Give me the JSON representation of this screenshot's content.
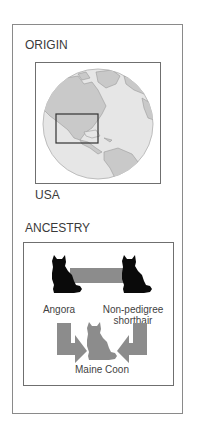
{
  "origin": {
    "heading": "ORIGIN",
    "country": "USA",
    "map_icon": "globe-icon",
    "highlight_region": "usa-highlight-box"
  },
  "ancestry": {
    "heading": "ANCESTRY",
    "parents": [
      {
        "label": "Angora",
        "icon": "black-cat-icon"
      },
      {
        "label_line1": "Non-pedigree",
        "label_line2": "shorthair",
        "icon": "black-cat-icon"
      }
    ],
    "offspring": {
      "label": "Maine Coon",
      "icon": "gray-cat-icon"
    },
    "connector_icon": "gray-bar-connector",
    "arrow_icons": [
      "arrow-down-right-icon",
      "arrow-down-left-icon"
    ]
  },
  "colors": {
    "border": "#8a8a8a",
    "globe_ocean": "#e6e6e6",
    "globe_land": "#c9c9c9",
    "highlight": "#333333",
    "parent_cat": "#0a0a0a",
    "offspring_cat": "#8c8c8c",
    "connector": "#8c8c8c"
  }
}
